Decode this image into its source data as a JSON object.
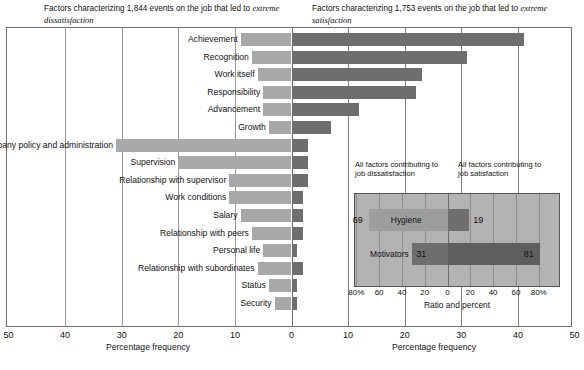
{
  "headers": {
    "left_pre": "Factors characterizing 1,844 events on the job that led to ",
    "left_em": "extreme dissatisfaction",
    "right_pre": "Factors characterizing 1,753 events on the job that led to ",
    "right_em": "extreme satisfaction"
  },
  "axes": {
    "left_title": "Percentage frequency",
    "right_title": "Percentage frequency",
    "left_ticks": [
      "50",
      "40",
      "30",
      "20",
      "10",
      "0"
    ],
    "right_ticks": [
      "0",
      "10",
      "20",
      "30",
      "40",
      "50"
    ]
  },
  "colors": {
    "dissatisfaction_bar": "#a8a8a8",
    "satisfaction_bar": "#6e6e6e",
    "right_panel_wash": "#b3b3b3",
    "frame": "#6f6f6f"
  },
  "chart_data": {
    "type": "bar",
    "xlabel": "Percentage frequency",
    "ylabel": "",
    "xlim": [
      -50,
      50
    ],
    "grid": true,
    "categories": [
      "Achievement",
      "Recognition",
      "Work itself",
      "Responsibility",
      "Advancement",
      "Growth",
      "Company policy and administration",
      "Supervision",
      "Relationship with supervisor",
      "Work conditions",
      "Salary",
      "Relationship with peers",
      "Personal life",
      "Relationship with subordinates",
      "Status",
      "Security"
    ],
    "series": [
      {
        "name": "extreme dissatisfaction",
        "side": "left",
        "values": [
          9,
          7,
          6,
          5,
          5,
          4,
          31,
          20,
          11,
          11,
          9,
          7,
          5,
          6,
          4,
          3
        ]
      },
      {
        "name": "extreme satisfaction",
        "side": "right",
        "values": [
          41,
          31,
          23,
          22,
          12,
          7,
          3,
          3,
          3,
          2,
          2,
          2,
          1,
          2,
          1,
          1
        ]
      }
    ]
  },
  "inset": {
    "caption_left": "All factors contributing to job dissatisfaction",
    "caption_right": "All factors contributing to job satisfaction",
    "axis_title": "Ratio and percent",
    "ticks": [
      "80%",
      "60",
      "40",
      "20",
      "0",
      "20",
      "40",
      "60",
      "80%"
    ],
    "tick_values": [
      -80,
      -60,
      -40,
      -20,
      0,
      20,
      40,
      60,
      80
    ],
    "rows": [
      {
        "name": "Hygiene",
        "left": 69,
        "right": 19,
        "left_label": "69",
        "right_label": "19"
      },
      {
        "name": "Motivators",
        "left": 31,
        "right": 81,
        "left_label": "31",
        "right_label": "81"
      }
    ]
  }
}
